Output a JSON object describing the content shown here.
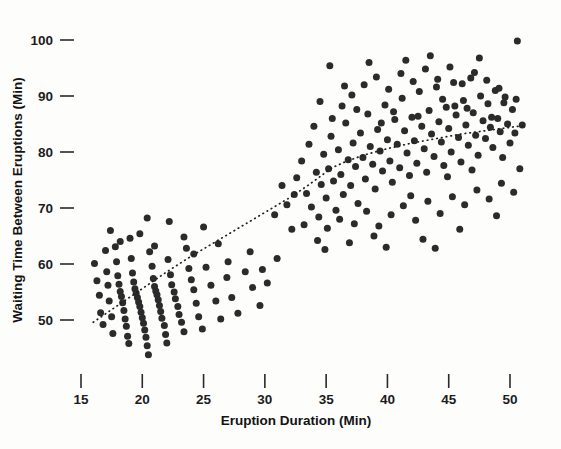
{
  "chart_data": {
    "type": "scatter",
    "title": "",
    "xlabel": "Eruption Duration (Min)",
    "ylabel": "Waiting Time Between Eruptions (Min)",
    "xlim": [
      13.5,
      52.0
    ],
    "ylim": [
      41.0,
      102.5
    ],
    "xticks": [
      15,
      20,
      25,
      30,
      35,
      40,
      45,
      50
    ],
    "yticks": [
      50,
      60,
      70,
      80,
      90,
      100
    ],
    "grid": false,
    "legend": null,
    "marker": {
      "shape": "circle",
      "color": "#2b2b2b",
      "size_px": 7
    },
    "annotations": [],
    "series": [
      {
        "name": "Old Faithful eruptions",
        "points": [
          [
            16.1,
            60.1
          ],
          [
            16.3,
            57.0
          ],
          [
            16.5,
            54.4
          ],
          [
            16.6,
            51.3
          ],
          [
            16.8,
            49.2
          ],
          [
            17.0,
            62.4
          ],
          [
            17.1,
            58.6
          ],
          [
            17.2,
            56.2
          ],
          [
            17.3,
            53.4
          ],
          [
            17.5,
            50.6
          ],
          [
            17.6,
            47.6
          ],
          [
            17.8,
            63.1
          ],
          [
            17.9,
            60.4
          ],
          [
            18.0,
            57.9
          ],
          [
            18.1,
            56.4
          ],
          [
            18.2,
            55.1
          ],
          [
            18.3,
            54.2
          ],
          [
            18.4,
            53.1
          ],
          [
            18.5,
            51.7
          ],
          [
            18.6,
            50.2
          ],
          [
            18.7,
            48.9
          ],
          [
            18.8,
            47.1
          ],
          [
            18.9,
            45.8
          ],
          [
            19.0,
            64.6
          ],
          [
            19.1,
            61.0
          ],
          [
            19.2,
            58.4
          ],
          [
            19.3,
            56.8
          ],
          [
            19.4,
            55.6
          ],
          [
            19.5,
            54.8
          ],
          [
            19.6,
            54.0
          ],
          [
            19.7,
            53.2
          ],
          [
            19.8,
            52.4
          ],
          [
            19.9,
            51.4
          ],
          [
            20.0,
            50.4
          ],
          [
            20.1,
            49.4
          ],
          [
            20.2,
            48.2
          ],
          [
            20.3,
            46.9
          ],
          [
            20.4,
            45.4
          ],
          [
            20.5,
            43.8
          ],
          [
            20.6,
            62.2
          ],
          [
            20.8,
            59.6
          ],
          [
            20.9,
            57.4
          ],
          [
            21.0,
            56.0
          ],
          [
            21.1,
            55.2
          ],
          [
            21.2,
            54.5
          ],
          [
            21.3,
            53.6
          ],
          [
            21.4,
            52.6
          ],
          [
            21.5,
            51.5
          ],
          [
            21.6,
            50.3
          ],
          [
            21.8,
            49.0
          ],
          [
            21.9,
            47.4
          ],
          [
            22.0,
            45.9
          ],
          [
            22.1,
            60.8
          ],
          [
            22.3,
            58.1
          ],
          [
            22.4,
            56.3
          ],
          [
            22.6,
            55.0
          ],
          [
            22.7,
            53.8
          ],
          [
            22.9,
            52.4
          ],
          [
            23.0,
            51.0
          ],
          [
            23.2,
            49.6
          ],
          [
            23.4,
            47.9
          ],
          [
            23.6,
            62.8
          ],
          [
            23.8,
            59.2
          ],
          [
            24.0,
            57.2
          ],
          [
            24.2,
            55.4
          ],
          [
            24.4,
            53.0
          ],
          [
            24.6,
            50.6
          ],
          [
            24.9,
            48.4
          ],
          [
            25.2,
            59.4
          ],
          [
            25.6,
            56.2
          ],
          [
            26.0,
            53.4
          ],
          [
            26.4,
            50.2
          ],
          [
            26.9,
            57.6
          ],
          [
            27.3,
            54.0
          ],
          [
            27.8,
            51.2
          ],
          [
            28.4,
            58.6
          ],
          [
            29.0,
            55.8
          ],
          [
            29.6,
            52.6
          ],
          [
            30.2,
            56.6
          ],
          [
            25.0,
            66.6
          ],
          [
            22.2,
            67.6
          ],
          [
            19.8,
            65.4
          ],
          [
            18.2,
            64.0
          ],
          [
            20.4,
            68.2
          ],
          [
            23.4,
            64.8
          ],
          [
            26.2,
            63.6
          ],
          [
            28.8,
            62.2
          ],
          [
            31.0,
            61.0
          ],
          [
            17.4,
            66.0
          ],
          [
            21.0,
            63.2
          ],
          [
            24.2,
            61.8
          ],
          [
            27.0,
            60.4
          ],
          [
            29.8,
            59.0
          ],
          [
            33.4,
            72.6
          ],
          [
            33.8,
            70.2
          ],
          [
            34.2,
            76.4
          ],
          [
            34.4,
            68.4
          ],
          [
            34.6,
            74.2
          ],
          [
            34.8,
            79.6
          ],
          [
            35.0,
            71.8
          ],
          [
            35.2,
            77.0
          ],
          [
            35.4,
            82.8
          ],
          [
            35.6,
            74.8
          ],
          [
            35.8,
            69.6
          ],
          [
            36.0,
            80.4
          ],
          [
            36.2,
            76.0
          ],
          [
            36.4,
            72.4
          ],
          [
            36.6,
            85.2
          ],
          [
            36.8,
            78.6
          ],
          [
            37.0,
            74.0
          ],
          [
            37.2,
            81.6
          ],
          [
            37.4,
            77.4
          ],
          [
            37.6,
            70.8
          ],
          [
            37.8,
            83.4
          ],
          [
            38.0,
            79.0
          ],
          [
            38.2,
            75.2
          ],
          [
            38.4,
            86.8
          ],
          [
            38.6,
            81.0
          ],
          [
            38.8,
            77.8
          ],
          [
            39.0,
            73.4
          ],
          [
            39.2,
            84.0
          ],
          [
            39.4,
            80.2
          ],
          [
            39.6,
            76.6
          ],
          [
            39.8,
            88.4
          ],
          [
            40.0,
            82.2
          ],
          [
            40.2,
            78.4
          ],
          [
            40.4,
            74.6
          ],
          [
            40.6,
            85.8
          ],
          [
            40.8,
            81.4
          ],
          [
            41.0,
            77.2
          ],
          [
            41.2,
            89.6
          ],
          [
            41.4,
            83.8
          ],
          [
            41.6,
            79.8
          ],
          [
            41.8,
            75.8
          ],
          [
            42.0,
            86.2
          ],
          [
            42.2,
            82.0
          ],
          [
            42.4,
            78.0
          ],
          [
            42.6,
            90.8
          ],
          [
            42.8,
            84.6
          ],
          [
            43.0,
            80.6
          ],
          [
            43.2,
            76.4
          ],
          [
            43.4,
            87.4
          ],
          [
            43.6,
            83.2
          ],
          [
            43.8,
            79.2
          ],
          [
            44.0,
            91.6
          ],
          [
            44.2,
            85.4
          ],
          [
            44.4,
            81.8
          ],
          [
            44.6,
            77.6
          ],
          [
            44.8,
            88.0
          ],
          [
            45.0,
            84.2
          ],
          [
            45.2,
            80.0
          ],
          [
            45.4,
            92.4
          ],
          [
            45.6,
            86.6
          ],
          [
            45.8,
            82.6
          ],
          [
            46.0,
            78.2
          ],
          [
            46.2,
            89.2
          ],
          [
            46.4,
            84.8
          ],
          [
            46.6,
            81.2
          ],
          [
            46.8,
            93.2
          ],
          [
            47.0,
            87.0
          ],
          [
            47.2,
            83.0
          ],
          [
            47.4,
            79.4
          ],
          [
            47.6,
            90.0
          ],
          [
            47.8,
            85.6
          ],
          [
            48.0,
            82.4
          ],
          [
            48.2,
            88.6
          ],
          [
            48.4,
            84.4
          ],
          [
            48.6,
            80.8
          ],
          [
            48.8,
            91.0
          ],
          [
            49.0,
            86.0
          ],
          [
            49.2,
            83.6
          ],
          [
            49.4,
            79.0
          ],
          [
            49.6,
            89.8
          ],
          [
            49.8,
            85.0
          ],
          [
            50.0,
            81.6
          ],
          [
            50.2,
            87.6
          ],
          [
            50.4,
            83.4
          ],
          [
            50.6,
            99.8
          ],
          [
            50.8,
            77.0
          ],
          [
            51.0,
            84.8
          ],
          [
            33.6,
            81.4
          ],
          [
            34.0,
            84.6
          ],
          [
            35.5,
            86.0
          ],
          [
            36.3,
            88.2
          ],
          [
            37.1,
            90.2
          ],
          [
            38.1,
            92.0
          ],
          [
            39.1,
            93.4
          ],
          [
            40.1,
            91.2
          ],
          [
            41.1,
            94.0
          ],
          [
            42.1,
            92.6
          ],
          [
            43.1,
            94.8
          ],
          [
            44.1,
            93.0
          ],
          [
            45.1,
            95.2
          ],
          [
            46.1,
            92.2
          ],
          [
            47.1,
            94.2
          ],
          [
            48.1,
            92.8
          ],
          [
            49.1,
            91.4
          ],
          [
            35.1,
            66.4
          ],
          [
            36.1,
            68.0
          ],
          [
            34.3,
            64.2
          ],
          [
            37.3,
            67.2
          ],
          [
            38.3,
            69.4
          ],
          [
            39.3,
            66.8
          ],
          [
            40.3,
            68.8
          ],
          [
            41.3,
            70.4
          ],
          [
            42.3,
            67.8
          ],
          [
            43.3,
            71.2
          ],
          [
            44.3,
            69.0
          ],
          [
            45.3,
            72.0
          ],
          [
            46.3,
            70.6
          ],
          [
            47.3,
            73.2
          ],
          [
            48.3,
            71.6
          ],
          [
            49.3,
            74.4
          ],
          [
            50.3,
            72.8
          ],
          [
            33.2,
            67.0
          ],
          [
            34.9,
            62.6
          ],
          [
            36.9,
            63.8
          ],
          [
            38.9,
            65.0
          ],
          [
            42.9,
            64.4
          ],
          [
            45.9,
            66.2
          ],
          [
            48.9,
            68.6
          ],
          [
            31.8,
            70.6
          ],
          [
            32.6,
            75.4
          ],
          [
            32.2,
            66.2
          ],
          [
            30.8,
            68.8
          ],
          [
            39.9,
            63.0
          ],
          [
            43.9,
            62.8
          ],
          [
            41.9,
            72.2
          ],
          [
            44.9,
            75.6
          ],
          [
            46.9,
            76.8
          ],
          [
            35.3,
            95.4
          ],
          [
            38.5,
            96.0
          ],
          [
            41.5,
            96.4
          ],
          [
            44.5,
            89.4
          ],
          [
            47.5,
            96.8
          ],
          [
            40.5,
            87.2
          ],
          [
            43.5,
            97.2
          ],
          [
            46.5,
            87.8
          ],
          [
            49.5,
            88.8
          ],
          [
            37.5,
            87.6
          ],
          [
            34.5,
            89.0
          ],
          [
            36.5,
            91.8
          ],
          [
            39.5,
            85.2
          ],
          [
            42.5,
            86.4
          ],
          [
            45.5,
            88.2
          ],
          [
            48.5,
            86.2
          ],
          [
            50.5,
            89.4
          ],
          [
            33.0,
            78.4
          ],
          [
            32.4,
            72.4
          ],
          [
            31.4,
            74.0
          ]
        ]
      }
    ],
    "trend_line": {
      "style": "dotted",
      "label": "smoothed fit",
      "points": [
        [
          16.0,
          49.6
        ],
        [
          18.0,
          52.6
        ],
        [
          20.0,
          55.6
        ],
        [
          22.0,
          58.6
        ],
        [
          24.0,
          61.4
        ],
        [
          26.0,
          64.0
        ],
        [
          28.0,
          66.6
        ],
        [
          30.0,
          69.2
        ],
        [
          32.0,
          71.8
        ],
        [
          33.5,
          74.0
        ],
        [
          34.5,
          75.6
        ],
        [
          35.5,
          77.2
        ],
        [
          36.5,
          78.2
        ],
        [
          38.0,
          79.4
        ],
        [
          40.0,
          80.6
        ],
        [
          42.0,
          81.6
        ],
        [
          44.0,
          82.4
        ],
        [
          46.0,
          83.2
        ],
        [
          48.0,
          83.8
        ],
        [
          50.0,
          84.4
        ],
        [
          51.1,
          84.7
        ]
      ]
    }
  },
  "axes": {
    "x_tick_labels": [
      "15",
      "20",
      "25",
      "30",
      "35",
      "40",
      "45",
      "50"
    ],
    "y_tick_labels": [
      "50",
      "60",
      "70",
      "80",
      "90",
      "100"
    ]
  }
}
